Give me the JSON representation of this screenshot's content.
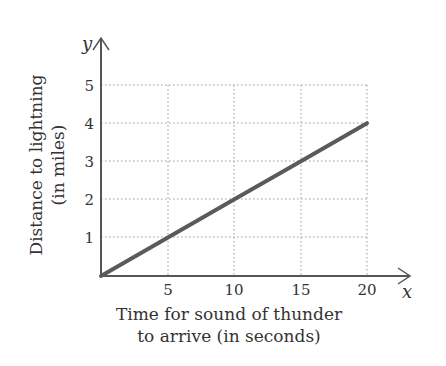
{
  "chart_data": {
    "type": "line",
    "title": "",
    "xlabel": "Time for sound of thunder to arrive (in seconds)",
    "xlabel_lines": [
      "Time for sound of thunder",
      "to arrive (in seconds)"
    ],
    "ylabel": "Distance to lightning (in miles)",
    "ylabel_lines": [
      "Distance to lightning",
      "(in miles)"
    ],
    "x_axis_var": "x",
    "y_axis_var": "y",
    "x_ticks": [
      "5",
      "10",
      "15",
      "20"
    ],
    "y_ticks": [
      "1",
      "2",
      "3",
      "4",
      "5"
    ],
    "xlim": [
      0,
      20
    ],
    "ylim": [
      0,
      5
    ],
    "grid": true,
    "grid_style": "dotted",
    "series": [
      {
        "name": "distance",
        "x": [
          0,
          5,
          10,
          15,
          20
        ],
        "y": [
          0,
          1,
          2,
          3,
          4
        ],
        "color": "#5a5a5a"
      }
    ]
  }
}
